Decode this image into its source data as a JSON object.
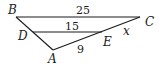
{
  "diagram": {
    "type": "triangle-similarity",
    "vertices": {
      "B": {
        "label": "B",
        "x": 16,
        "y": 17
      },
      "C": {
        "label": "C",
        "x": 140,
        "y": 17
      },
      "A": {
        "label": "A",
        "x": 53,
        "y": 50
      },
      "D": {
        "label": "D",
        "x": 33,
        "y": 33
      },
      "E": {
        "label": "E",
        "x": 102,
        "y": 32
      }
    },
    "segments": [
      {
        "name": "BC",
        "from": "B",
        "to": "C",
        "label": "25"
      },
      {
        "name": "DE",
        "from": "D",
        "to": "E",
        "label": "15"
      },
      {
        "name": "AE",
        "from": "A",
        "to": "E",
        "label": "9"
      },
      {
        "name": "EC",
        "from": "E",
        "to": "C",
        "label": "x"
      },
      {
        "name": "AB",
        "from": "A",
        "to": "B",
        "label": ""
      }
    ],
    "labels": {
      "B": "B",
      "C": "C",
      "D": "D",
      "E": "E",
      "A": "A",
      "bc_length": "25",
      "de_length": "15",
      "ae_length": "9",
      "ec_length": "x"
    }
  }
}
